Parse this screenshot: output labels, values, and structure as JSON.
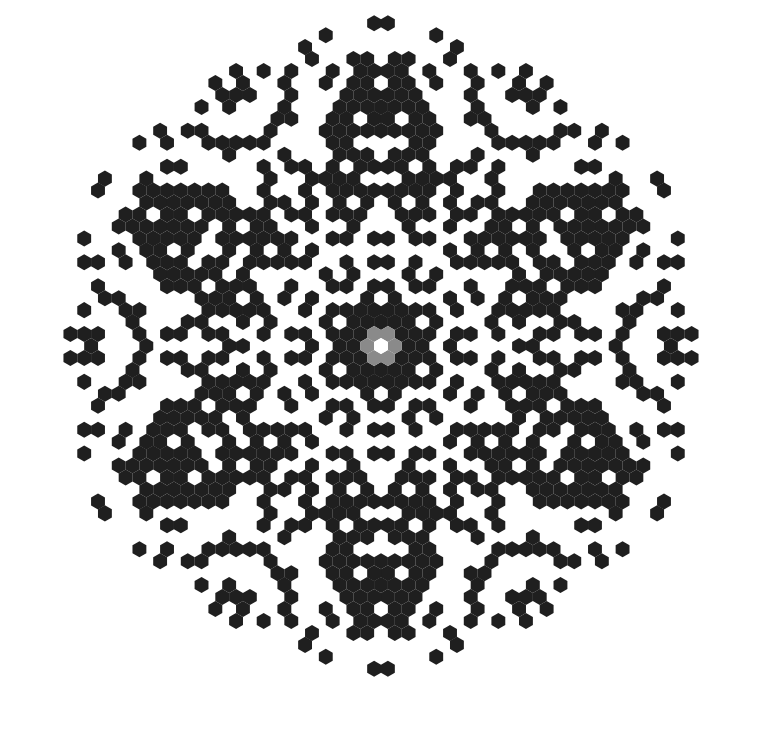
{
  "figure": {
    "width": 774,
    "height": 731,
    "background": "#ffffff"
  },
  "grid": {
    "orientation": "pointy-top",
    "center_x": 381,
    "center_y": 346,
    "hex_size": 7.97,
    "draw_scale": 0.93,
    "max_radius_px": 330,
    "symmetry": "D6"
  },
  "colors": {
    "live": "#1f1f1f",
    "seed_ring": "#8a8a8a",
    "seed_center": "#ffffff"
  },
  "center": {
    "seed_cell": [
      0,
      0
    ],
    "seed_ring_distance": 1,
    "solid_black_max_distance": 3
  },
  "flower_holes": [
    [
      2,
      -4
    ]
  ],
  "sector_cells": [
    [
      9,
      -16
    ],
    [
      11,
      -15
    ],
    [
      9,
      -14
    ],
    [
      11,
      -14
    ],
    [
      10,
      -13
    ],
    [
      13,
      -15
    ],
    [
      14,
      -15
    ],
    [
      15,
      -16
    ],
    [
      12,
      -13
    ],
    [
      13,
      -12
    ],
    [
      11,
      -11
    ],
    [
      7,
      -13
    ],
    [
      6,
      -13
    ],
    [
      7,
      -12
    ],
    [
      8,
      -11
    ],
    [
      9,
      -11
    ],
    [
      7,
      -10
    ],
    [
      7,
      -9
    ],
    [
      8,
      -9
    ],
    [
      4,
      -9
    ],
    [
      5,
      -9
    ],
    [
      9,
      -8
    ],
    [
      9,
      -7
    ],
    [
      10,
      -7
    ],
    [
      11,
      -8
    ],
    [
      11,
      -9
    ],
    [
      6,
      -7
    ],
    [
      5,
      -6
    ],
    [
      5,
      -5
    ],
    [
      6,
      -5
    ],
    [
      7,
      -6
    ],
    [
      9,
      -5
    ],
    [
      9,
      -4
    ],
    [
      7,
      -4
    ],
    [
      7,
      -3
    ],
    [
      11,
      -7
    ],
    [
      4,
      -3
    ],
    [
      5,
      -3
    ],
    [
      17,
      -24
    ],
    [
      18,
      -23
    ],
    [
      20,
      -23
    ],
    [
      21,
      -22
    ],
    [
      20,
      -21
    ],
    [
      22,
      -23
    ],
    [
      17,
      -21
    ],
    [
      17,
      -20
    ],
    [
      16,
      -19
    ],
    [
      21,
      -20
    ],
    [
      21,
      -21
    ],
    [
      22,
      -21
    ],
    [
      17,
      -18
    ],
    [
      17,
      -17
    ],
    [
      18,
      -17
    ],
    [
      19,
      -17
    ],
    [
      20,
      -17
    ],
    [
      19,
      -16
    ],
    [
      15,
      -14
    ],
    [
      22,
      -18
    ],
    [
      14,
      -27
    ],
    [
      13,
      -27
    ],
    [
      19,
      -28
    ],
    [
      19,
      -27
    ],
    [
      17,
      -26
    ],
    [
      18,
      -25
    ],
    [
      13,
      -24
    ],
    [
      10,
      -24
    ],
    [
      11,
      -23
    ],
    [
      12,
      -23
    ],
    [
      13,
      -22
    ],
    [
      13,
      -21
    ],
    [
      15,
      -23
    ],
    [
      15,
      -22
    ],
    [
      10,
      -21
    ],
    [
      11,
      -21
    ],
    [
      9,
      -19
    ],
    [
      10,
      -19
    ],
    [
      12,
      -19
    ],
    [
      13,
      -19
    ],
    [
      11,
      -17
    ],
    [
      12,
      -17
    ],
    [
      15,
      -13
    ],
    [
      18,
      -12
    ],
    [
      18,
      -13
    ],
    [
      20,
      -13
    ],
    [
      21,
      -13
    ],
    [
      17,
      -12
    ],
    [
      17,
      -11
    ],
    [
      14,
      -11
    ],
    [
      15,
      -11
    ],
    [
      13,
      -10
    ],
    [
      20,
      -11
    ],
    [
      20,
      -10
    ],
    [
      18,
      -10
    ],
    [
      18,
      -9
    ],
    [
      13,
      -9
    ],
    [
      15,
      -9
    ],
    [
      23,
      -13
    ],
    [
      22,
      -12
    ],
    [
      21,
      -9
    ],
    [
      20,
      -8
    ],
    [
      12,
      -7
    ],
    [
      13,
      -7
    ],
    [
      13,
      -6
    ],
    [
      12,
      -5
    ],
    [
      15,
      -7
    ],
    [
      18,
      -7
    ],
    [
      18,
      -6
    ],
    [
      16,
      -6
    ],
    [
      16,
      -5
    ],
    [
      13,
      -5
    ],
    [
      14,
      -4
    ],
    [
      13,
      -3
    ],
    [
      12,
      -3
    ],
    [
      10,
      -3
    ],
    [
      11,
      -3
    ],
    [
      9,
      -2
    ],
    [
      11,
      -2
    ],
    [
      9,
      -1
    ],
    [
      14,
      -2
    ],
    [
      15,
      -1
    ],
    [
      16,
      -1
    ],
    [
      12,
      -1
    ],
    [
      6,
      -1
    ],
    [
      7,
      -1
    ],
    [
      5,
      0
    ],
    [
      10,
      0
    ]
  ]
}
